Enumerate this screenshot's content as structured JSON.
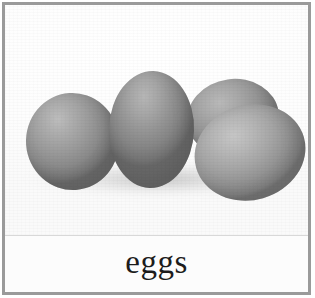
{
  "card": {
    "border_color": "#9a9a9a",
    "background_color": "#ffffff"
  },
  "photo": {
    "alt_name": "eggs-photograph",
    "background_color": "#ffffff",
    "subject": "four grey eggs",
    "eggs": [
      {
        "name": "egg-back",
        "color": "#959595"
      },
      {
        "name": "egg-left",
        "color": "#9a9a9a"
      },
      {
        "name": "egg-center",
        "color": "#959595"
      },
      {
        "name": "egg-right",
        "color": "#a4a4a4"
      }
    ]
  },
  "caption": {
    "label": "eggs",
    "text_color": "#1c1c1c"
  }
}
